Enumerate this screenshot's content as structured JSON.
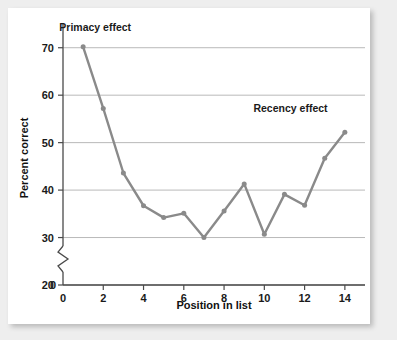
{
  "chart_data": {
    "type": "line",
    "title": "",
    "xlabel": "Position in list",
    "ylabel": "Percent correct",
    "x": [
      1,
      2,
      3,
      4,
      5,
      6,
      7,
      8,
      9,
      10,
      11,
      12,
      13,
      14
    ],
    "values": [
      70.2,
      57.2,
      43.6,
      36.7,
      34.2,
      35.1,
      30.0,
      35.6,
      41.3,
      30.7,
      39.1,
      36.8,
      46.7,
      52.2
    ],
    "series": [
      {
        "name": "Percent correct",
        "values": [
          70.2,
          57.2,
          43.6,
          36.7,
          34.2,
          35.1,
          30.0,
          35.6,
          41.3,
          30.7,
          39.1,
          36.8,
          46.7,
          52.2
        ],
        "color": "#8a8a8a"
      }
    ],
    "xlim": [
      0,
      15
    ],
    "ylim": [
      20,
      75
    ],
    "xticks": [
      2,
      4,
      6,
      8,
      10,
      12,
      14
    ],
    "xtick_labels": [
      "2",
      "4",
      "6",
      "8",
      "10",
      "12",
      "14"
    ],
    "x_origin_label": "0",
    "yticks": [
      20,
      30,
      40,
      50,
      60,
      70
    ],
    "ytick_labels": [
      "20",
      "30",
      "40",
      "50",
      "60",
      "70"
    ],
    "y_origin_label": "0",
    "grid": "horizontal",
    "y_axis_break": true,
    "legend": "none",
    "annotations": [
      {
        "text": "Primacy effect",
        "x": 1.6,
        "y": 73.5,
        "name": "primacy-effect-annotation"
      },
      {
        "text": "Recency effect",
        "x": 11.3,
        "y": 56.5,
        "name": "recency-effect-annotation"
      }
    ],
    "marker": "circle",
    "line_color": "#8a8a8a",
    "grid_color": "#b9b9b9",
    "axis_color": "#4a4a4a",
    "background": "#ffffff"
  }
}
